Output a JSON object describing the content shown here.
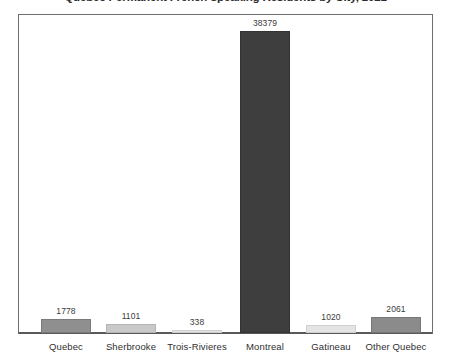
{
  "chart_data": {
    "type": "bar",
    "title": "Quebec Permanent French-speaking Residents by City, 2021",
    "title_clipped": true,
    "xlabel": "",
    "ylabel": "",
    "categories": [
      "Quebec",
      "Sherbrooke",
      "Trois-Rivieres",
      "Montreal",
      "Gatineau",
      "Other Quebec"
    ],
    "values": [
      1778,
      1101,
      338,
      38379,
      1020,
      2061
    ],
    "value_labels": [
      "1778",
      "1101",
      "338",
      "38379",
      "1020",
      "2061"
    ],
    "ylim": [
      0,
      41000
    ],
    "grid": false,
    "legend": false,
    "axis_visible": {
      "x_baseline": true,
      "y_axis": false,
      "frame": true
    },
    "bar_colors": [
      "#8f8f8f",
      "#c9c9c9",
      "#e2e2e2",
      "#3e3e3e",
      "#e4e4e4",
      "#8b8b8b"
    ],
    "bar_border_colors": [
      "#7b7b7b",
      "#b4b4b4",
      "#cfcfcf",
      "#333333",
      "#d0d0d0",
      "#777777"
    ]
  },
  "colors": {
    "frame": "#6e6e6e",
    "baseline": "#58595b",
    "background": "#ffffff",
    "value_text": "#3a3a3a",
    "category_text": "#2f2f2f",
    "title_text": "#2b2b2b"
  }
}
